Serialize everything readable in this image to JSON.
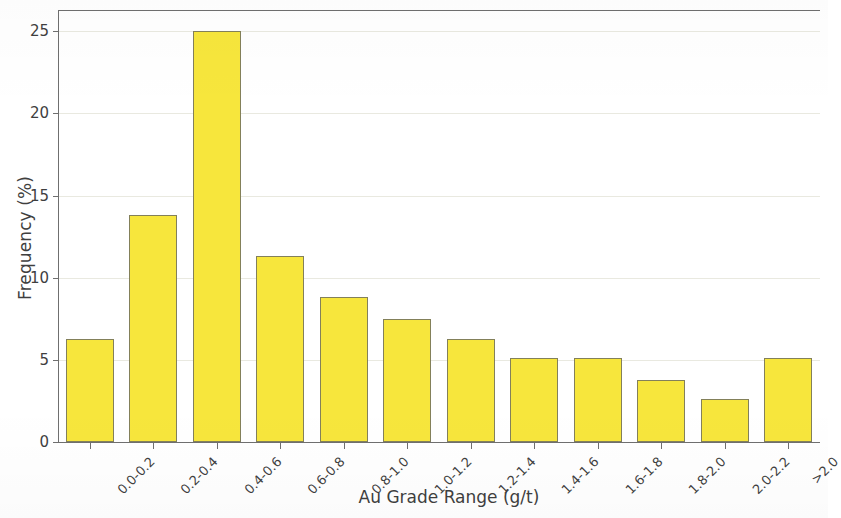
{
  "chart_data": {
    "type": "bar",
    "title": "",
    "subtitle": "",
    "xlabel": "Au Grade Range (g/t)",
    "ylabel": "Frequency (%)",
    "categories": [
      "0.0-0.2",
      "0.2-0.4",
      "0.4-0.6",
      "0.6-0.8",
      "0.8-1.0",
      "1.0-1.2",
      "1.2-1.4",
      "1.4-1.6",
      "1.6-1.8",
      "1.8-2.0",
      "2.0-2.2",
      ">2.0"
    ],
    "values": [
      6.3,
      13.8,
      25.0,
      11.3,
      8.8,
      7.5,
      6.3,
      5.1,
      5.1,
      3.8,
      2.6,
      5.1
    ],
    "ylim": [
      0,
      26.3
    ],
    "yticks": [
      0,
      5,
      10,
      15,
      20,
      25
    ],
    "ytick_labels": [
      "0",
      "5",
      "10",
      "15",
      "20",
      "25"
    ],
    "xlim": [
      0,
      12
    ],
    "grid": true,
    "grid_axis": "y",
    "legend": false,
    "legend_position": "none",
    "bar_fill_color": "#f7e63c",
    "bar_edge_color": "#83805a",
    "axis_color": "#6f6f6f",
    "text_color": "#3f3f3f",
    "background_color": "#ffffff",
    "xtick_label_rotation": -45
  }
}
